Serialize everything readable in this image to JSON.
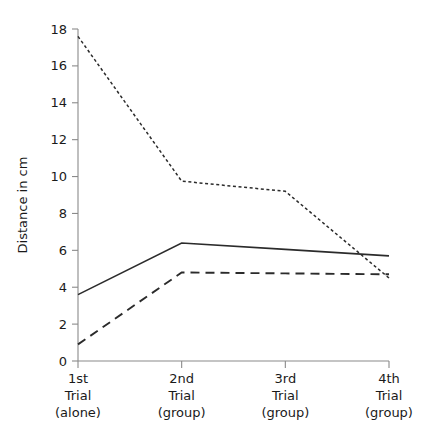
{
  "chart_data": {
    "type": "line",
    "title": "",
    "xlabel": "",
    "ylabel": "Distance in cm",
    "categories": [
      "1st\nTrial\n(alone)",
      "2nd\nTrial\n(group)",
      "3rd\nTrial\n(group)",
      "4th\nTrial\n(group)"
    ],
    "category_lines": [
      [
        "1st",
        "Trial",
        "(alone)"
      ],
      [
        "2nd",
        "Trial",
        "(group)"
      ],
      [
        "3rd",
        "Trial",
        "(group)"
      ],
      [
        "4th",
        "Trial",
        "(group)"
      ]
    ],
    "ylim": [
      0,
      18
    ],
    "yticks": [
      0,
      2,
      4,
      6,
      8,
      10,
      12,
      14,
      16,
      18
    ],
    "ytick_labels": [
      "0",
      "2",
      "4",
      "6",
      "8",
      "10",
      "12",
      "14",
      "16",
      "18"
    ],
    "grid": false,
    "legend": "none",
    "series": [
      {
        "name": "dotted-series",
        "style": "dotted",
        "color": "#2b2b2b",
        "values": [
          17.6,
          9.75,
          9.2,
          4.5
        ]
      },
      {
        "name": "solid-series",
        "style": "solid",
        "color": "#2b2b2b",
        "values": [
          3.6,
          6.4,
          6.05,
          5.7
        ]
      },
      {
        "name": "dashed-series",
        "style": "dashed",
        "color": "#2b2b2b",
        "values": [
          0.9,
          4.8,
          4.75,
          4.7
        ]
      }
    ]
  },
  "axis": {
    "y_title": "Distance in cm",
    "axis_color": "#8a8a8a"
  }
}
